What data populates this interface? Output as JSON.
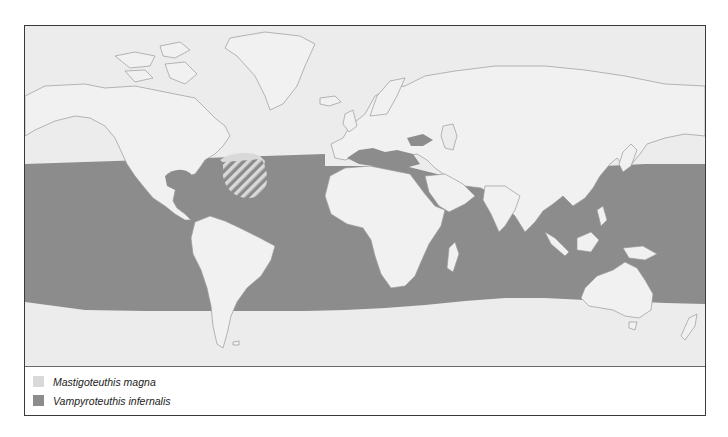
{
  "map": {
    "type": "species-distribution-map",
    "projection": "world",
    "colors": {
      "ocean": "#ececec",
      "land": "#f1f1f1",
      "coastline": "#9a9a9a",
      "vampyroteuthis_range": "#8c8c8c",
      "mastigoteuthis_range": "#d9d9d9",
      "frame": "#3a3a3a"
    },
    "ranges": [
      {
        "species": "Vampyroteuthis infernalis",
        "extent": "circumglobal tropical and temperate oceans (~40°N to ~40°S)"
      },
      {
        "species": "Mastigoteuthis magna",
        "extent": "western North Atlantic patch (overlap shown hatched)"
      }
    ]
  },
  "legend": {
    "items": [
      {
        "label": "Mastigoteuthis magna",
        "color": "#d9d9d9",
        "icon": "light-grey-swatch"
      },
      {
        "label": "Vampyroteuthis infernalis",
        "color": "#8c8c8c",
        "icon": "dark-grey-swatch"
      }
    ]
  }
}
